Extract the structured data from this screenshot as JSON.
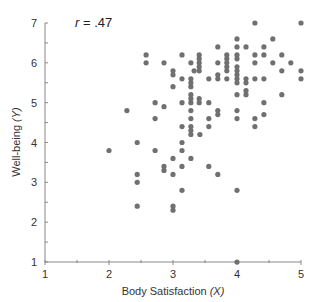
{
  "chart_data": {
    "type": "scatter",
    "title": "",
    "annotation": {
      "prefix": "r",
      "text": " = .47"
    },
    "xlabel": {
      "main": "Body Satisfaction ",
      "var": "(X)"
    },
    "ylabel": {
      "main": "Well-being ",
      "var": "(Y)"
    },
    "xlim": [
      1,
      5
    ],
    "ylim": [
      1,
      7
    ],
    "xticks": [
      1,
      2,
      3,
      4,
      5
    ],
    "yticks": [
      1,
      2,
      3,
      4,
      5,
      6,
      7
    ],
    "minor_tick_step": 0.5,
    "grid": false,
    "legend": null,
    "colors": {
      "point": "#707070",
      "axis": "#888888",
      "text": "#333333"
    },
    "points": [
      [
        2.0,
        3.8
      ],
      [
        2.28,
        4.8
      ],
      [
        2.44,
        4.0
      ],
      [
        2.44,
        3.2
      ],
      [
        2.44,
        3.0
      ],
      [
        2.44,
        2.4
      ],
      [
        2.58,
        6.2
      ],
      [
        2.58,
        6.0
      ],
      [
        2.72,
        5.0
      ],
      [
        2.72,
        4.6
      ],
      [
        2.72,
        3.8
      ],
      [
        2.86,
        6.0
      ],
      [
        2.86,
        4.9
      ],
      [
        2.86,
        3.4
      ],
      [
        2.86,
        3.3
      ],
      [
        3.0,
        5.8
      ],
      [
        3.0,
        5.7
      ],
      [
        3.0,
        5.4
      ],
      [
        3.0,
        3.6
      ],
      [
        3.0,
        3.2
      ],
      [
        3.0,
        2.4
      ],
      [
        3.0,
        2.3
      ],
      [
        3.14,
        6.2
      ],
      [
        3.14,
        5.6
      ],
      [
        3.14,
        5.0
      ],
      [
        3.14,
        4.4
      ],
      [
        3.14,
        4.0
      ],
      [
        3.14,
        3.8
      ],
      [
        3.14,
        3.4
      ],
      [
        3.14,
        2.8
      ],
      [
        3.28,
        6.0
      ],
      [
        3.28,
        5.6
      ],
      [
        3.28,
        5.5
      ],
      [
        3.28,
        5.4
      ],
      [
        3.28,
        5.2
      ],
      [
        3.28,
        5.1
      ],
      [
        3.28,
        5.0
      ],
      [
        3.28,
        4.8
      ],
      [
        3.28,
        4.6
      ],
      [
        3.28,
        4.4
      ],
      [
        3.28,
        4.3
      ],
      [
        3.28,
        4.2
      ],
      [
        3.28,
        3.6
      ],
      [
        3.33,
        5.8
      ],
      [
        3.41,
        6.2
      ],
      [
        3.41,
        6.1
      ],
      [
        3.41,
        6.0
      ],
      [
        3.41,
        5.9
      ],
      [
        3.41,
        5.8
      ],
      [
        3.41,
        5.1
      ],
      [
        3.41,
        5.0
      ],
      [
        3.42,
        4.2
      ],
      [
        3.56,
        5.6
      ],
      [
        3.56,
        5.0
      ],
      [
        3.56,
        4.6
      ],
      [
        3.56,
        4.4
      ],
      [
        3.56,
        3.4
      ],
      [
        3.7,
        6.4
      ],
      [
        3.7,
        6.0
      ],
      [
        3.7,
        5.7
      ],
      [
        3.7,
        5.6
      ],
      [
        3.7,
        4.8
      ],
      [
        3.7,
        4.7
      ],
      [
        3.7,
        3.2
      ],
      [
        3.84,
        6.2
      ],
      [
        3.84,
        6.1
      ],
      [
        3.84,
        6.0
      ],
      [
        3.84,
        5.9
      ],
      [
        3.84,
        5.8
      ],
      [
        3.84,
        5.6
      ],
      [
        4.0,
        6.6
      ],
      [
        4.0,
        6.4
      ],
      [
        4.0,
        6.2
      ],
      [
        4.0,
        6.1
      ],
      [
        4.0,
        5.9
      ],
      [
        4.0,
        5.8
      ],
      [
        4.0,
        5.7
      ],
      [
        4.0,
        5.6
      ],
      [
        4.0,
        5.5
      ],
      [
        4.0,
        5.2
      ],
      [
        4.0,
        4.8
      ],
      [
        4.0,
        4.6
      ],
      [
        4.0,
        2.8
      ],
      [
        4.0,
        1.0
      ],
      [
        4.14,
        6.4
      ],
      [
        4.14,
        5.6
      ],
      [
        4.14,
        5.5
      ],
      [
        4.14,
        5.3
      ],
      [
        4.14,
        5.2
      ],
      [
        4.28,
        7.0
      ],
      [
        4.28,
        6.2
      ],
      [
        4.28,
        6.0
      ],
      [
        4.28,
        5.6
      ],
      [
        4.28,
        4.6
      ],
      [
        4.28,
        4.4
      ],
      [
        4.42,
        6.4
      ],
      [
        4.42,
        6.2
      ],
      [
        4.42,
        5.6
      ],
      [
        4.42,
        5.0
      ],
      [
        4.42,
        4.7
      ],
      [
        4.56,
        6.6
      ],
      [
        4.56,
        6.0
      ],
      [
        4.7,
        6.2
      ],
      [
        4.7,
        5.8
      ],
      [
        4.7,
        5.2
      ],
      [
        4.84,
        6.0
      ],
      [
        5.0,
        7.0
      ],
      [
        5.0,
        5.8
      ],
      [
        5.0,
        5.6
      ]
    ]
  }
}
